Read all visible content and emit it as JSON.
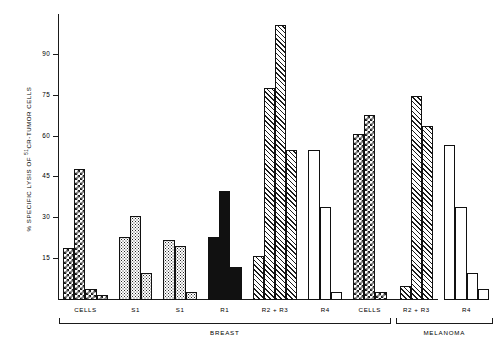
{
  "chart_data": {
    "type": "bar",
    "title": "",
    "xlabel": "",
    "ylabel": "% SPECIFIC LYSIS OF 51CR-TUMOR CELLS",
    "ylabel_prefix": "% SPECIFIC LYSIS OF ",
    "ylabel_sup": "51",
    "ylabel_suffix": "CR-TUMOR CELLS",
    "ylim": [
      0,
      105
    ],
    "yticks": [
      15,
      30,
      45,
      60,
      75,
      90
    ],
    "ytick_labels": [
      "15",
      "30",
      "45",
      "60",
      "75",
      "90"
    ],
    "grid": false,
    "legend": "none",
    "groups": [
      {
        "label": "CELLS",
        "fill": "checker",
        "supergroup": "BREAST",
        "values": [
          19,
          48,
          4,
          2
        ]
      },
      {
        "label": "S1",
        "fill": "dots",
        "supergroup": "BREAST",
        "values": [
          23,
          31,
          10
        ]
      },
      {
        "label": "S1",
        "fill": "dots",
        "supergroup": "BREAST",
        "values": [
          22,
          20,
          3
        ]
      },
      {
        "label": "R1",
        "fill": "solid",
        "supergroup": "BREAST",
        "values": [
          23,
          40,
          12
        ]
      },
      {
        "label": "R2 + R3",
        "fill": "hatch",
        "supergroup": "BREAST",
        "values": [
          16,
          78,
          101,
          55
        ]
      },
      {
        "label": "R4",
        "fill": "open",
        "supergroup": "BREAST",
        "values": [
          55,
          34,
          3
        ]
      },
      {
        "label": "CELLS",
        "fill": "checker",
        "supergroup": "BREAST",
        "values": [
          61,
          68,
          3
        ]
      },
      {
        "label": "R2 + R3",
        "fill": "hatch",
        "supergroup": "MELANOMA",
        "values": [
          5,
          75,
          64
        ]
      },
      {
        "label": "R4",
        "fill": "open",
        "supergroup": "MELANOMA",
        "values": [
          57,
          34,
          10,
          4
        ]
      }
    ],
    "supergroups": [
      {
        "label": "BREAST"
      },
      {
        "label": "MELANOMA"
      }
    ]
  }
}
